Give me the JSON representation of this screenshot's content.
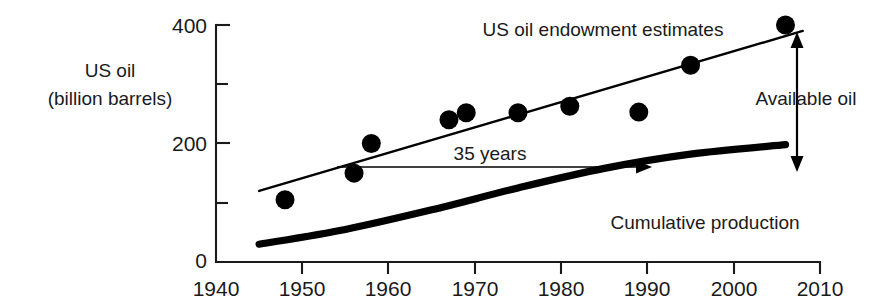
{
  "chart_data": {
    "type": "scatter",
    "title": "",
    "xlabel": "",
    "ylabel": "US oil (billion barrels)",
    "ylabel_line1": "US oil",
    "ylabel_line2": "(billion barrels)",
    "xlim": [
      1940,
      2010
    ],
    "ylim": [
      0,
      400
    ],
    "grid": false,
    "legend_position": "inline-annotations",
    "x_ticks": [
      1940,
      1950,
      1960,
      1970,
      1980,
      1990,
      2000,
      2010
    ],
    "x_tick_labels": [
      "1940",
      "1950",
      "1960",
      "1970",
      "1980",
      "1990",
      "2000",
      "2010"
    ],
    "y_ticks": [
      0,
      100,
      200,
      300,
      400
    ],
    "y_tick_labels": [
      "0",
      "",
      "200",
      "",
      "400"
    ],
    "y_major_labels": [
      "0",
      "200",
      "400"
    ],
    "series": [
      {
        "name": "US oil endowment estimates",
        "type": "scatter",
        "marker": "filled-circle",
        "color": "#000000",
        "points": [
          {
            "x": 1948,
            "y": 105
          },
          {
            "x": 1956,
            "y": 150
          },
          {
            "x": 1958,
            "y": 200
          },
          {
            "x": 1967,
            "y": 240
          },
          {
            "x": 1969,
            "y": 252
          },
          {
            "x": 1975,
            "y": 252
          },
          {
            "x": 1981,
            "y": 263
          },
          {
            "x": 1989,
            "y": 253
          },
          {
            "x": 1995,
            "y": 332
          },
          {
            "x": 2006,
            "y": 400
          }
        ]
      },
      {
        "name": "Endowment trend line",
        "type": "line",
        "color": "#000000",
        "points": [
          {
            "x": 1945,
            "y": 120
          },
          {
            "x": 2008,
            "y": 390
          }
        ]
      },
      {
        "name": "Cumulative production",
        "type": "line",
        "color": "#000000",
        "points": [
          {
            "x": 1945,
            "y": 30
          },
          {
            "x": 1955,
            "y": 55
          },
          {
            "x": 1965,
            "y": 88
          },
          {
            "x": 1975,
            "y": 125
          },
          {
            "x": 1985,
            "y": 158
          },
          {
            "x": 1995,
            "y": 182
          },
          {
            "x": 2006,
            "y": 198
          }
        ]
      }
    ],
    "annotations": [
      {
        "name": "endowment-label",
        "text": "US oil endowment estimates",
        "x": 1973,
        "y": 388
      },
      {
        "name": "cumulative-label",
        "text": "Cumulative production",
        "x": 1991,
        "y": 72
      },
      {
        "name": "years-span-label",
        "text": "35 years",
        "x": 1968,
        "y": 180,
        "arrow_from": {
          "x": 1954,
          "y": 162
        },
        "arrow_to": {
          "x": 1989,
          "y": 162
        }
      },
      {
        "name": "available-oil-label",
        "text": "Available oil",
        "x": 2007,
        "y": 255,
        "arrow_top": {
          "x": 2007,
          "y": 378
        },
        "arrow_bottom": {
          "x": 2007,
          "y": 165
        }
      }
    ]
  },
  "axis": {
    "y_label_400": "400",
    "y_label_200": "200",
    "y_label_0": "0",
    "x_label_1940": "1940",
    "x_label_1950": "1950",
    "x_label_1960": "1960",
    "x_label_1970": "1970",
    "x_label_1980": "1980",
    "x_label_1990": "1990",
    "x_label_2000": "2000",
    "x_label_2010": "2010"
  },
  "labels": {
    "y_title_line1": "US oil",
    "y_title_line2": "(billion barrels)",
    "endowment": "US oil endowment estimates",
    "cumulative": "Cumulative production",
    "years_span": "35 years",
    "available_oil": "Available oil"
  }
}
